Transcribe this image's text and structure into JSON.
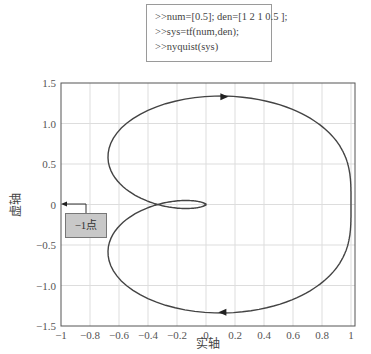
{
  "code": {
    "lines": [
      ">>num=[0.5]; den=[1 2 1 0.5 ];",
      ">>sys=tf(num,den);",
      ">>nyquist(sys)"
    ]
  },
  "callout": {
    "label": "−1点",
    "points_to": [
      -1,
      0
    ]
  },
  "chart_data": {
    "type": "line",
    "title": "",
    "xlabel": "实轴",
    "ylabel": "虚轴",
    "xlim": [
      -1,
      1.05
    ],
    "ylim": [
      -1.5,
      1.5
    ],
    "grid": true,
    "xticks": [
      -1,
      -0.8,
      -0.6,
      -0.4,
      -0.2,
      0,
      0.2,
      0.4,
      0.6,
      0.8,
      1
    ],
    "xtick_labels": [
      "−1",
      "−0.8",
      "−0.6",
      "−0.4",
      "−0.2",
      "0",
      "0.2",
      "0.4",
      "0.6",
      "0.8",
      "1"
    ],
    "yticks": [
      1.5,
      1.0,
      0.5,
      0,
      -0.5,
      -1.0,
      -1.5
    ],
    "ytick_labels": [
      "1.5",
      "1.0",
      "0.5",
      "0",
      "−0.5",
      "−1.0",
      "−1.5"
    ],
    "transfer_function": {
      "num": [
        0.5
      ],
      "den": [
        1,
        2,
        1,
        0.5
      ]
    },
    "series": [
      {
        "name": "Nyquist G(jω), ω>0",
        "key_points": [
          [
            1.0,
            0
          ],
          [
            0.1,
            -1.33
          ],
          [
            -0.66,
            -0.55
          ],
          [
            -0.33,
            0
          ],
          [
            0,
            0
          ]
        ]
      },
      {
        "name": "Nyquist G(jω), ω<0 (mirror)",
        "key_points": [
          [
            0,
            0
          ],
          [
            -0.33,
            0
          ],
          [
            -0.66,
            0.55
          ],
          [
            0.1,
            1.33
          ],
          [
            1.0,
            0
          ]
        ]
      }
    ],
    "arrows": [
      [
        0.12,
        1.33
      ],
      [
        0.12,
        -1.33
      ]
    ],
    "line_color": "#444444"
  }
}
